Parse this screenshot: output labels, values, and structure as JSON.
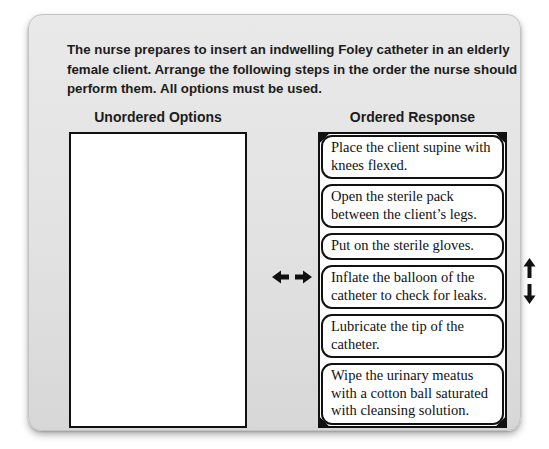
{
  "question": {
    "text": "The nurse prepares to insert an indwelling Foley catheter in an elderly female client. Arrange the following steps in the order the nurse should perform them.",
    "emphasis": "All options must be used."
  },
  "columns": {
    "unordered": {
      "header": "Unordered Options",
      "items": []
    },
    "ordered": {
      "header": "Ordered Response",
      "items": [
        "Place the client supine with knees flexed.",
        "Open the sterile pack between the client’s legs.",
        "Put on the sterile gloves.",
        "Inflate the balloon of the catheter to check for leaks.",
        "Lubricate the tip of the catheter.",
        "Wipe the urinary meatus with a cotton ball saturated with cleansing solution."
      ]
    }
  },
  "icons": {
    "horizontal_move": "left-right-arrows",
    "vertical_move": "up-down-arrows"
  },
  "colors": {
    "card_background": "#e2e2e2",
    "box_border": "#111111",
    "text": "#1c1c1c",
    "page_background": "#ffffff"
  }
}
